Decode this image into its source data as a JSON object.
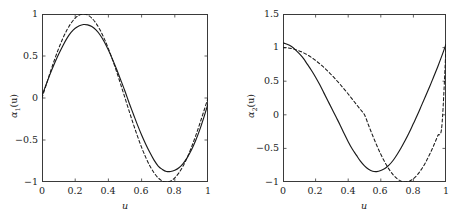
{
  "figure": {
    "background": "#ffffff",
    "axis_color": "#3a3a3a",
    "solid_color": "#1a1a1a",
    "dashed_color": "#1a1a1a"
  },
  "panels": [
    {
      "id": "panel-alpha1",
      "ylabel_alpha": "α",
      "ylabel_sub": "1",
      "ylabel_arg": "(u)",
      "xlabel": "u",
      "xticks": [
        "0",
        "0.2",
        "0.4",
        "0.6",
        "0.8",
        "1"
      ],
      "yticks": [
        "1",
        "0.5",
        "0",
        "−0.5",
        "−1"
      ]
    },
    {
      "id": "panel-alpha2",
      "ylabel_alpha": "α",
      "ylabel_sub": "2",
      "ylabel_arg": "(u)",
      "xlabel": "u",
      "xticks": [
        "0",
        "0.2",
        "0.4",
        "0.6",
        "0.8",
        "1"
      ],
      "yticks": [
        "1.5",
        "1",
        "0.5",
        "0",
        "−0.5",
        "−1"
      ]
    }
  ],
  "chart_data": [
    {
      "type": "line",
      "title": "",
      "xlabel": "u",
      "ylabel": "alpha_1(u)",
      "xlim": [
        0,
        1
      ],
      "ylim": [
        -1,
        1
      ],
      "xticks": [
        0,
        0.2,
        0.4,
        0.6,
        0.8,
        1
      ],
      "yticks": [
        -1,
        -0.5,
        0,
        0.5,
        1
      ],
      "grid": false,
      "legend": "none",
      "x": [
        0,
        0.025,
        0.05,
        0.075,
        0.1,
        0.125,
        0.15,
        0.175,
        0.2,
        0.225,
        0.25,
        0.275,
        0.3,
        0.325,
        0.35,
        0.375,
        0.4,
        0.425,
        0.45,
        0.475,
        0.5,
        0.525,
        0.55,
        0.575,
        0.6,
        0.625,
        0.65,
        0.675,
        0.7,
        0.725,
        0.75,
        0.775,
        0.8,
        0.825,
        0.85,
        0.875,
        0.9,
        0.925,
        0.95,
        0.975,
        1
      ],
      "series": [
        {
          "name": "estimate",
          "style": "solid",
          "values": [
            0.03,
            0.16,
            0.29,
            0.41,
            0.52,
            0.62,
            0.71,
            0.78,
            0.83,
            0.86,
            0.875,
            0.87,
            0.85,
            0.81,
            0.75,
            0.67,
            0.57,
            0.46,
            0.34,
            0.21,
            0.08,
            -0.06,
            -0.19,
            -0.32,
            -0.44,
            -0.55,
            -0.65,
            -0.74,
            -0.81,
            -0.85,
            -0.875,
            -0.875,
            -0.86,
            -0.83,
            -0.78,
            -0.71,
            -0.62,
            -0.51,
            -0.38,
            -0.23,
            -0.07
          ]
        },
        {
          "name": "true",
          "style": "dashed",
          "values": [
            0.0,
            0.156,
            0.309,
            0.454,
            0.588,
            0.707,
            0.809,
            0.891,
            0.951,
            0.988,
            1.0,
            0.988,
            0.951,
            0.891,
            0.809,
            0.707,
            0.588,
            0.454,
            0.309,
            0.156,
            0.0,
            -0.156,
            -0.309,
            -0.454,
            -0.588,
            -0.707,
            -0.809,
            -0.891,
            -0.951,
            -0.988,
            -1.0,
            -0.988,
            -0.951,
            -0.891,
            -0.809,
            -0.707,
            -0.588,
            -0.454,
            -0.309,
            -0.156,
            0.0
          ]
        }
      ]
    },
    {
      "type": "line",
      "title": "",
      "xlabel": "u",
      "ylabel": "alpha_2(u)",
      "xlim": [
        0,
        1
      ],
      "ylim": [
        -1,
        1.5
      ],
      "xticks": [
        0,
        0.2,
        0.4,
        0.6,
        0.8,
        1
      ],
      "yticks": [
        -1,
        -0.5,
        0,
        0.5,
        1,
        1.5
      ],
      "grid": false,
      "legend": "none",
      "x": [
        0,
        0.025,
        0.05,
        0.075,
        0.1,
        0.125,
        0.15,
        0.175,
        0.2,
        0.225,
        0.25,
        0.275,
        0.3,
        0.325,
        0.35,
        0.375,
        0.4,
        0.425,
        0.45,
        0.475,
        0.5,
        0.525,
        0.55,
        0.575,
        0.6,
        0.625,
        0.65,
        0.675,
        0.7,
        0.725,
        0.75,
        0.775,
        0.8,
        0.825,
        0.85,
        0.875,
        0.9,
        0.925,
        0.95,
        0.975,
        1
      ],
      "series": [
        {
          "name": "estimate",
          "style": "solid",
          "values": [
            1.07,
            1.05,
            1.02,
            0.97,
            0.91,
            0.84,
            0.75,
            0.66,
            0.56,
            0.45,
            0.33,
            0.21,
            0.09,
            -0.03,
            -0.15,
            -0.28,
            -0.4,
            -0.51,
            -0.6,
            -0.69,
            -0.76,
            -0.81,
            -0.84,
            -0.845,
            -0.83,
            -0.8,
            -0.75,
            -0.68,
            -0.59,
            -0.49,
            -0.38,
            -0.26,
            -0.13,
            0.0,
            0.14,
            0.28,
            0.42,
            0.57,
            0.72,
            0.88,
            1.05
          ]
        },
        {
          "name": "true",
          "style": "dashed",
          "values": [
            1.0,
            0.997,
            0.988,
            0.972,
            0.951,
            0.924,
            0.891,
            0.853,
            0.809,
            0.76,
            0.707,
            0.649,
            0.588,
            0.522,
            0.454,
            0.383,
            0.309,
            0.233,
            0.156,
            0.078,
            0.0,
            -0.156,
            -0.309,
            -0.454,
            -0.588,
            -0.707,
            -0.809,
            -0.891,
            -0.951,
            -0.988,
            -1.0,
            -0.988,
            -0.951,
            -0.891,
            -0.809,
            -0.707,
            -0.588,
            -0.454,
            -0.309,
            -0.156,
            1.0
          ]
        }
      ]
    }
  ]
}
